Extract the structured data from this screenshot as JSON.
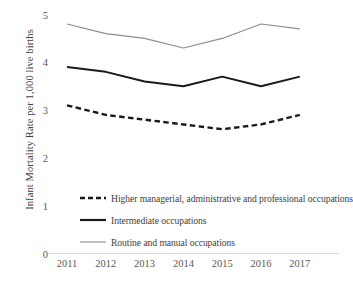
{
  "chart_data": {
    "type": "line",
    "title": "",
    "xlabel": "",
    "ylabel": "Infant Mortality Rate per 1,000 live births",
    "categories": [
      "2011",
      "2012",
      "2013",
      "2014",
      "2015",
      "2016",
      "2017"
    ],
    "x": [
      2011,
      2012,
      2013,
      2014,
      2015,
      2016,
      2017
    ],
    "ylim": [
      0,
      5
    ],
    "yticks": [
      0,
      1,
      2,
      3,
      4,
      5
    ],
    "ytick_labels": [
      "0",
      "1",
      "2",
      "3",
      "4",
      "5"
    ],
    "grid": false,
    "legend_position": "inside-lower-left",
    "series": [
      {
        "name": "Higher managerial, administrative and professional occupations",
        "values": [
          3.1,
          2.9,
          2.8,
          2.7,
          2.6,
          2.7,
          2.9
        ],
        "style": "dashed",
        "color": "#1a1a1a",
        "width": 2.4
      },
      {
        "name": "Intermediate occupations",
        "values": [
          3.9,
          3.8,
          3.6,
          3.5,
          3.7,
          3.5,
          3.7
        ],
        "style": "solid",
        "color": "#1a1a1a",
        "width": 2.0
      },
      {
        "name": "Routine and manual occupations",
        "values": [
          4.8,
          4.6,
          4.5,
          4.3,
          4.5,
          4.8,
          4.7
        ],
        "style": "solid",
        "color": "#8c8c8c",
        "width": 1.1
      }
    ]
  },
  "axis": {
    "axis_line_color": "#d9d9d9"
  },
  "legend": {
    "items": [
      {
        "label": "Higher managerial, administrative and professional occupations"
      },
      {
        "label": "Intermediate occupations"
      },
      {
        "label": "Routine and manual occupations"
      }
    ]
  }
}
